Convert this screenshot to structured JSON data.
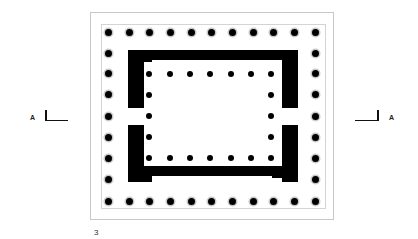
{
  "figure": {
    "number": "3",
    "type": "temple plan (peripteral)",
    "section_marker_left": "A",
    "section_marker_right": "A"
  },
  "outer_colonnade": {
    "front_columns": 11,
    "side_columns": 9,
    "xs": [
      108,
      129,
      149,
      170,
      191,
      211,
      232,
      253,
      273,
      294,
      315
    ],
    "ys": [
      32,
      53,
      73,
      94,
      116,
      137,
      158,
      179,
      201
    ]
  },
  "inner_colonnade": {
    "front_columns": 7,
    "side_columns": 5,
    "xs": [
      149,
      170,
      190,
      210,
      231,
      251,
      271
    ],
    "ys": [
      74,
      95,
      116,
      137,
      158
    ]
  },
  "colors": {
    "ink": "#000000",
    "frame": "#c8c8c8",
    "column_halo": "#c9c9c9",
    "background": "#ffffff"
  }
}
